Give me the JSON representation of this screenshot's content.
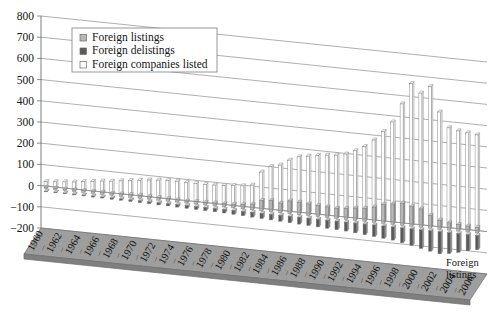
{
  "chart_data": {
    "type": "bar",
    "title": "",
    "subtitle": "",
    "xlabel": "",
    "ylabel": "",
    "series_axis_label": "Foreign listings",
    "ylim": [
      -200,
      800
    ],
    "ytick_step": 100,
    "yticks": [
      "800",
      "700",
      "600",
      "500",
      "400",
      "300",
      "200",
      "100",
      "0",
      "−100",
      "−200"
    ],
    "grid": true,
    "legend_position": "top-left",
    "projection": "3d-perspective",
    "xtick_label_interval": 2,
    "categories": [
      "1960",
      "1961",
      "1962",
      "1963",
      "1964",
      "1965",
      "1966",
      "1967",
      "1968",
      "1969",
      "1970",
      "1971",
      "1972",
      "1973",
      "1974",
      "1975",
      "1976",
      "1977",
      "1978",
      "1979",
      "1980",
      "1981",
      "1982",
      "1983",
      "1984",
      "1985",
      "1986",
      "1987",
      "1988",
      "1989",
      "1990",
      "1991",
      "1992",
      "1993",
      "1994",
      "1995",
      "1996",
      "1997",
      "1998",
      "1999",
      "2000",
      "2001",
      "2002",
      "2003",
      "2004",
      "2005",
      "2006"
    ],
    "tick_labels": [
      "1960",
      "1962",
      "1964",
      "1966",
      "1968",
      "1970",
      "1972",
      "1974",
      "1976",
      "1978",
      "1980",
      "1982",
      "1984",
      "1986",
      "1988",
      "1990",
      "1992",
      "1994",
      "1996",
      "1998",
      "2000",
      "2002",
      "2004",
      "2006"
    ],
    "series": [
      {
        "name": "Foreign listings",
        "color": "#b8b8b8",
        "values": [
          4,
          6,
          5,
          7,
          8,
          9,
          10,
          9,
          11,
          12,
          14,
          13,
          12,
          11,
          10,
          9,
          11,
          12,
          14,
          15,
          17,
          20,
          26,
          48,
          52,
          45,
          60,
          58,
          55,
          52,
          50,
          48,
          52,
          58,
          62,
          72,
          88,
          96,
          104,
          92,
          86,
          60,
          42,
          34,
          30,
          28,
          26
        ]
      },
      {
        "name": "Foreign delistings",
        "color": "#5a5a5a",
        "values": [
          -2,
          -3,
          -3,
          -4,
          -4,
          -5,
          -5,
          -6,
          -6,
          -7,
          -8,
          -9,
          -10,
          -10,
          -11,
          -12,
          -13,
          -14,
          -15,
          -16,
          -18,
          -20,
          -22,
          -24,
          -26,
          -28,
          -30,
          -32,
          -34,
          -36,
          -38,
          -40,
          -42,
          -46,
          -50,
          -54,
          -58,
          -62,
          -70,
          -78,
          -88,
          -96,
          -104,
          -98,
          -88,
          -76,
          -66
        ]
      },
      {
        "name": "Foreign companies listed",
        "color": "#ffffff",
        "values": [
          20,
          24,
          28,
          32,
          38,
          44,
          50,
          54,
          60,
          66,
          72,
          78,
          82,
          84,
          86,
          84,
          84,
          84,
          86,
          88,
          92,
          96,
          104,
          170,
          200,
          212,
          240,
          260,
          268,
          276,
          282,
          286,
          296,
          316,
          340,
          376,
          420,
          470,
          560,
          660,
          620,
          655,
          540,
          470,
          460,
          455,
          450
        ]
      }
    ],
    "legend": [
      {
        "label": "Foreign listings",
        "swatch": "#b8b8b8"
      },
      {
        "label": "Foreign delistings",
        "swatch": "#5a5a5a"
      },
      {
        "label": "Foreign companies listed",
        "swatch": "#ffffff"
      }
    ]
  }
}
